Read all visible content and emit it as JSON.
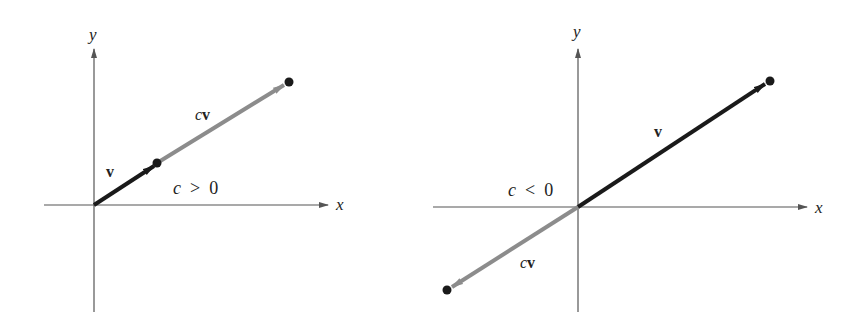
{
  "figures": [
    {
      "id": "left",
      "condition": "c > 0",
      "axes": {
        "x_label": "x",
        "y_label": "y"
      },
      "vectors": [
        {
          "name": "v",
          "label_scalar": "",
          "label_vector": "v",
          "color": "#1a1a1a"
        },
        {
          "name": "cv",
          "label_scalar": "c",
          "label_vector": "v",
          "color": "#8c8c8c"
        }
      ],
      "condition_parts": {
        "var": "c",
        "op": ">",
        "val": "0"
      }
    },
    {
      "id": "right",
      "condition": "c < 0",
      "axes": {
        "x_label": "x",
        "y_label": "y"
      },
      "vectors": [
        {
          "name": "v",
          "label_scalar": "",
          "label_vector": "v",
          "color": "#1a1a1a"
        },
        {
          "name": "cv",
          "label_scalar": "c",
          "label_vector": "v",
          "color": "#8c8c8c"
        }
      ],
      "condition_parts": {
        "var": "c",
        "op": "<",
        "val": "0"
      }
    }
  ],
  "colors": {
    "axis": "#555555",
    "v": "#1a1a1a",
    "cv": "#8c8c8c",
    "point": "#1a1a1a"
  }
}
